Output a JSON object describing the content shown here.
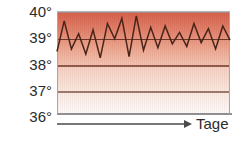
{
  "chart_data": {
    "type": "line",
    "title": "",
    "subtitle": "",
    "xlabel": "Tage",
    "ylabel": "",
    "ylim": [
      36,
      40
    ],
    "xlim": [
      0,
      24
    ],
    "ytick_labels": [
      "40°",
      "39°",
      "38°",
      "37°",
      "36°"
    ],
    "ytick_values": [
      40,
      39,
      38,
      37,
      36
    ],
    "xtick_labels": [],
    "grid": true,
    "legend": null,
    "series": [
      {
        "name": "Temperatur",
        "x": [
          0,
          1,
          2,
          3,
          4,
          5,
          6,
          7,
          8,
          9,
          10,
          11,
          12,
          13,
          14,
          15,
          16,
          17,
          18,
          19,
          20,
          21,
          22,
          23,
          24
        ],
        "values": [
          38.45,
          39.65,
          38.55,
          39.15,
          38.35,
          39.3,
          38.2,
          39.55,
          38.95,
          39.75,
          38.25,
          39.85,
          38.5,
          39.4,
          38.6,
          39.45,
          38.75,
          39.2,
          38.65,
          39.55,
          38.8,
          39.35,
          38.55,
          39.45,
          38.9
        ]
      }
    ],
    "bands": [
      {
        "name": "fieber-band",
        "from": 38,
        "to": 40,
        "color_top": "#de6a52",
        "color_bottom": "#f3b7a4"
      },
      {
        "name": "erhoeht-band",
        "from": 36,
        "to": 38,
        "color_top": "#f7cdbd",
        "color_bottom": "#fdf6f3"
      }
    ],
    "colors": {
      "line": "#4a2418",
      "gridline": "#7a4030",
      "axis": "#585858",
      "plot_border": "#8a8a8a",
      "text": "#2b2b2b",
      "background": "#ffffff"
    },
    "arrow": {
      "name": "time-axis-arrow",
      "direction": "right"
    }
  },
  "labels": {
    "y40": "40°",
    "y39": "39°",
    "y38": "38°",
    "y37": "37°",
    "y36": "36°",
    "x_axis_title": "Tage"
  }
}
